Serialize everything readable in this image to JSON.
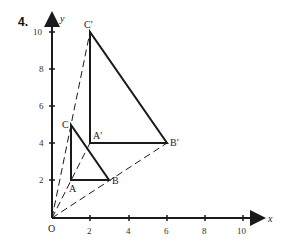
{
  "problem_number": "4.",
  "axes": {
    "x_label": "x",
    "y_label": "y",
    "origin_label": "O",
    "x_ticks": [
      "2",
      "4",
      "6",
      "8",
      "10"
    ],
    "y_ticks": [
      "2",
      "4",
      "6",
      "8",
      "10"
    ]
  },
  "points": {
    "A": {
      "label": "A",
      "x": 1,
      "y": 2
    },
    "B": {
      "label": "B",
      "x": 3,
      "y": 2
    },
    "C": {
      "label": "C",
      "x": 1,
      "y": 5
    },
    "A_prime": {
      "label": "A′",
      "x": 2,
      "y": 4
    },
    "B_prime": {
      "label": "B′",
      "x": 6,
      "y": 4
    },
    "C_prime": {
      "label": "C′",
      "x": 2,
      "y": 10
    }
  },
  "triangles": [
    {
      "name": "ABC",
      "vertices": [
        "A",
        "B",
        "C"
      ]
    },
    {
      "name": "A'B'C'",
      "vertices": [
        "A_prime",
        "B_prime",
        "C_prime"
      ]
    }
  ],
  "dashed_rays_from_origin": [
    "A_prime",
    "B_prime",
    "C_prime"
  ],
  "colors": {
    "ink": "#1a1a1a"
  }
}
